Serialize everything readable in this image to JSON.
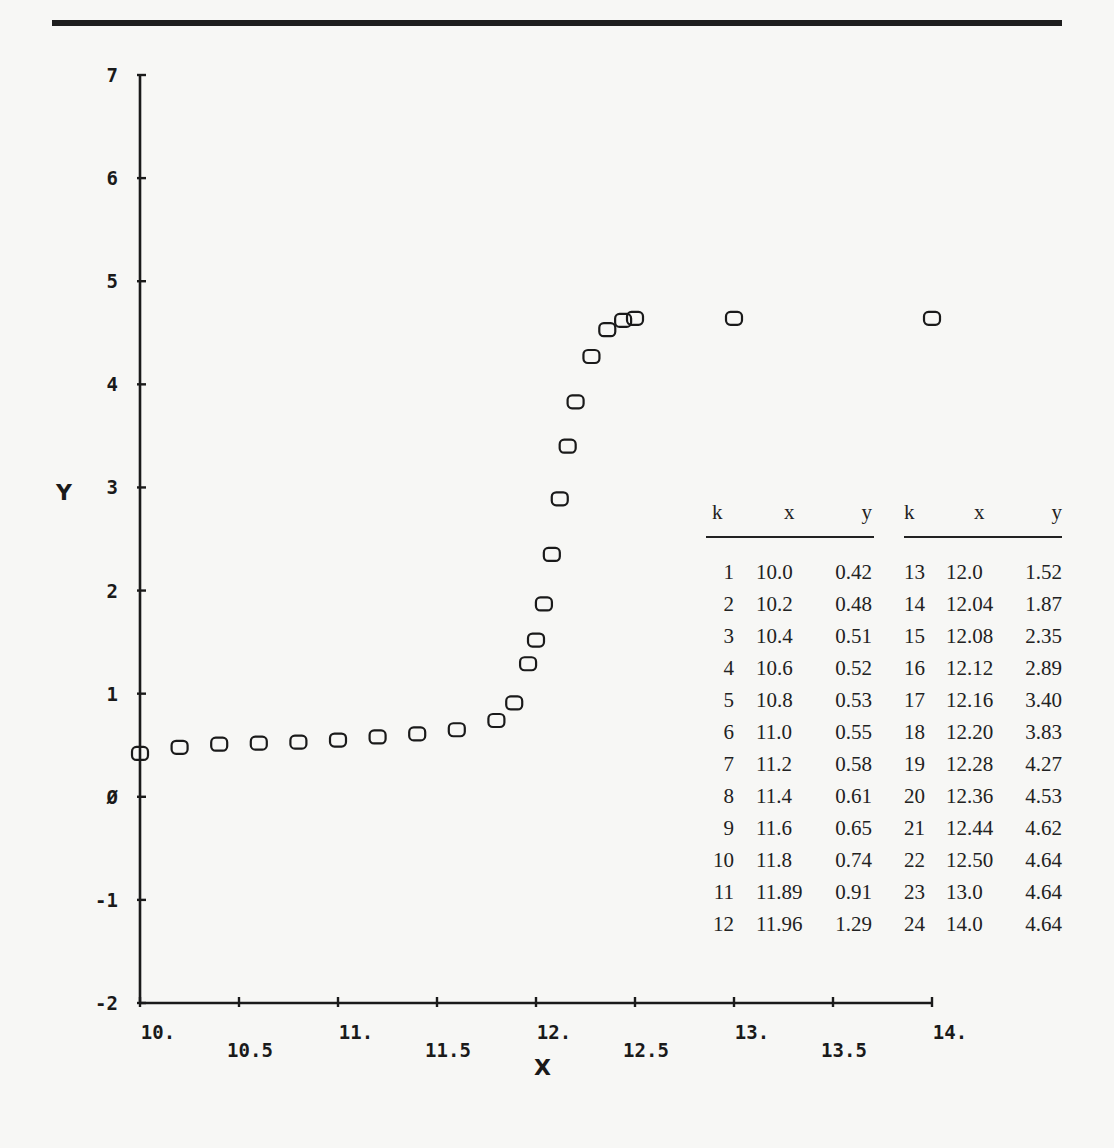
{
  "chart_data": {
    "type": "scatter",
    "title": "",
    "xlabel": "X",
    "ylabel": "Y",
    "xlim": [
      10,
      14
    ],
    "ylim": [
      -2,
      7
    ],
    "grid": false,
    "marker": "rounded-square-open",
    "x_ticks_major": [
      "10.",
      "11.",
      "12.",
      "13.",
      "14."
    ],
    "x_ticks_minor": [
      "10.5",
      "11.5",
      "12.5",
      "13.5"
    ],
    "y_ticks": [
      "-2",
      "-1",
      "Ø",
      "1",
      "2",
      "3",
      "4",
      "5",
      "6",
      "7"
    ],
    "series": [
      {
        "name": "data",
        "k": [
          1,
          2,
          3,
          4,
          5,
          6,
          7,
          8,
          9,
          10,
          11,
          12,
          13,
          14,
          15,
          16,
          17,
          18,
          19,
          20,
          21,
          22,
          23,
          24
        ],
        "x": [
          10.0,
          10.2,
          10.4,
          10.6,
          10.8,
          11.0,
          11.2,
          11.4,
          11.6,
          11.8,
          11.89,
          11.96,
          12.0,
          12.04,
          12.08,
          12.12,
          12.16,
          12.2,
          12.28,
          12.36,
          12.44,
          12.5,
          13.0,
          14.0
        ],
        "y": [
          0.42,
          0.48,
          0.51,
          0.52,
          0.53,
          0.55,
          0.58,
          0.61,
          0.65,
          0.74,
          0.91,
          1.29,
          1.52,
          1.87,
          2.35,
          2.89,
          3.4,
          3.83,
          4.27,
          4.53,
          4.62,
          4.64,
          4.64,
          4.64
        ]
      }
    ]
  },
  "axes": {
    "x_title": "X",
    "y_title": "Y"
  },
  "table": {
    "headers": [
      "k",
      "x",
      "y"
    ],
    "left_rows": [
      [
        "1",
        "10.0",
        "0.42"
      ],
      [
        "2",
        "10.2",
        "0.48"
      ],
      [
        "3",
        "10.4",
        "0.51"
      ],
      [
        "4",
        "10.6",
        "0.52"
      ],
      [
        "5",
        "10.8",
        "0.53"
      ],
      [
        "6",
        "11.0",
        "0.55"
      ],
      [
        "7",
        "11.2",
        "0.58"
      ],
      [
        "8",
        "11.4",
        "0.61"
      ],
      [
        "9",
        "11.6",
        "0.65"
      ],
      [
        "10",
        "11.8",
        "0.74"
      ],
      [
        "11",
        "11.89",
        "0.91"
      ],
      [
        "12",
        "11.96",
        "1.29"
      ]
    ],
    "right_rows": [
      [
        "13",
        "12.0",
        "1.52"
      ],
      [
        "14",
        "12.04",
        "1.87"
      ],
      [
        "15",
        "12.08",
        "2.35"
      ],
      [
        "16",
        "12.12",
        "2.89"
      ],
      [
        "17",
        "12.16",
        "3.40"
      ],
      [
        "18",
        "12.20",
        "3.83"
      ],
      [
        "19",
        "12.28",
        "4.27"
      ],
      [
        "20",
        "12.36",
        "4.53"
      ],
      [
        "21",
        "12.44",
        "4.62"
      ],
      [
        "22",
        "12.50",
        "4.64"
      ],
      [
        "23",
        "13.0",
        "4.64"
      ],
      [
        "24",
        "14.0",
        "4.64"
      ]
    ]
  }
}
